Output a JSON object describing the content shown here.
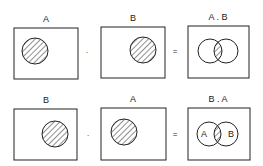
{
  "rows": [
    {
      "operand1": {
        "label": "A"
      },
      "operator": "·",
      "operand2": {
        "label": "B"
      },
      "equals": "=",
      "result": {
        "label": "A . B",
        "circle_labels": [
          "",
          ""
        ]
      }
    },
    {
      "operand1": {
        "label": "B"
      },
      "operator": "·",
      "operand2": {
        "label": "A"
      },
      "equals": "=",
      "result": {
        "label": "B . A",
        "circle_labels": [
          "A",
          "B"
        ]
      }
    }
  ]
}
